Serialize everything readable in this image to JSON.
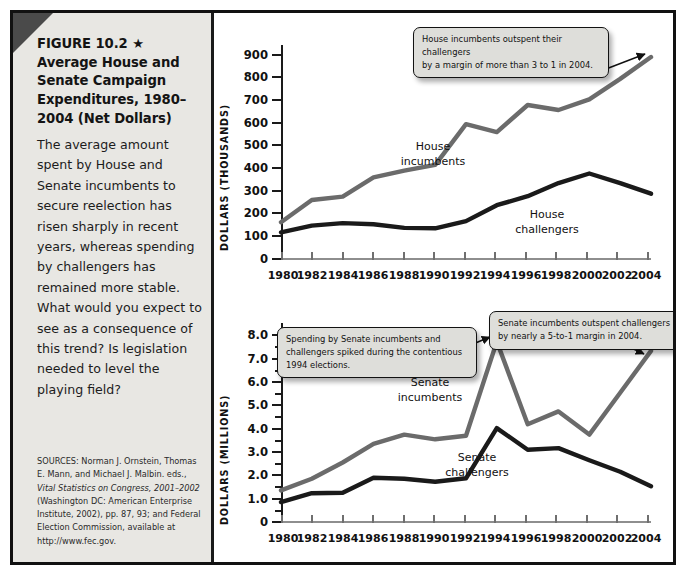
{
  "figure": {
    "title_lines": [
      "FIGURE 10.2 ★",
      "Average House and",
      "Senate Campaign",
      "Expenditures, 1980–",
      "2004 (Net Dollars)"
    ],
    "caption": "The average amount spent by House and Senate incumbents to secure reelection has risen sharply in recent years, whereas spending by challengers has remained more stable. What would you expect to see as a consequence of this trend? Is legislation needed to level the playing field?",
    "sources_label": "SOURCES:",
    "sources": "SOURCES: Norman J. Ornstein, Thomas E. Mann, and Michael J. Malbin. eds., Vital Statistics on Congress, 2001–2002 (Washington DC: American Enterprise Institute, 2002), pp. 87, 93; and Federal Election Commission, available at http://www.fec.gov.",
    "sources_italic_part": "Vital Statistics on Congress, 2001–2002",
    "corner_color": "#4a4a4a",
    "panel_color": "#e8e7e3",
    "incumbent_color": "#6b6b6b",
    "challenger_color": "#1a1a1a"
  },
  "chart_data": [
    {
      "type": "line",
      "id": "house",
      "title": "",
      "xlabel": "",
      "ylabel": "DOLLARS (THOUSANDS)",
      "x": [
        1980,
        1982,
        1984,
        1986,
        1988,
        1990,
        1992,
        1994,
        1996,
        1998,
        2000,
        2002,
        2004
      ],
      "xtick_labels": [
        "1980",
        "1982",
        "1984",
        "1986",
        "1988",
        "1990",
        "1992",
        "1994",
        "1996",
        "1998",
        "2000",
        "2002",
        "2004"
      ],
      "ytick_labels": [
        "0",
        "100",
        "200",
        "300",
        "400",
        "500",
        "600",
        "700",
        "800",
        "900"
      ],
      "yticks": [
        0,
        100,
        200,
        300,
        400,
        500,
        600,
        700,
        800,
        900
      ],
      "ylim": [
        0,
        950
      ],
      "xlim": [
        1980,
        2004
      ],
      "grid": false,
      "legend": "inline-labels",
      "series": [
        {
          "name": "House incumbents",
          "color": "#6b6b6b",
          "values": [
            167,
            265,
            280,
            365,
            395,
            420,
            600,
            565,
            685,
            663,
            710,
            800,
            897
          ]
        },
        {
          "name": "House challengers",
          "color": "#1a1a1a",
          "values": [
            122,
            152,
            163,
            158,
            142,
            140,
            172,
            242,
            282,
            340,
            382,
            340,
            293
          ]
        }
      ]
    },
    {
      "type": "line",
      "id": "senate",
      "title": "",
      "xlabel": "",
      "ylabel": "DOLLARS (MILLIONS)",
      "x": [
        1980,
        1982,
        1984,
        1986,
        1988,
        1990,
        1992,
        1994,
        1996,
        1998,
        2000,
        2002,
        2004
      ],
      "xtick_labels": [
        "1980",
        "1982",
        "1984",
        "1986",
        "1988",
        "1990",
        "1992",
        "1994",
        "1996",
        "1998",
        "2000",
        "2002",
        "2004"
      ],
      "ytick_labels": [
        "0",
        "1.0",
        "2.0",
        "3.0",
        "4.0",
        "5.0",
        "6.0",
        "7.0",
        "8.0"
      ],
      "yticks": [
        0,
        1,
        2,
        3,
        4,
        5,
        6,
        7,
        8
      ],
      "ylim": [
        0,
        8.6
      ],
      "xlim": [
        1980,
        2004
      ],
      "grid": false,
      "legend": "inline-labels",
      "series": [
        {
          "name": "Senate incumbents",
          "color": "#6b6b6b",
          "values": [
            1.4,
            1.9,
            2.6,
            3.4,
            3.8,
            3.6,
            3.75,
            7.8,
            4.25,
            4.8,
            3.8,
            5.6,
            7.4
          ]
        },
        {
          "name": "Senate challengers",
          "color": "#1a1a1a",
          "values": [
            0.9,
            1.28,
            1.3,
            1.95,
            1.9,
            1.77,
            1.92,
            4.08,
            3.15,
            3.22,
            2.7,
            2.2,
            1.58
          ]
        }
      ]
    }
  ],
  "series_labels": {
    "house_incumbents": [
      "House",
      "incumbents"
    ],
    "house_challengers": [
      "House",
      "challengers"
    ],
    "senate_incumbents": [
      "Senate",
      "incumbents"
    ],
    "senate_challengers": [
      "Senate",
      "challengers"
    ]
  },
  "callouts": [
    {
      "id": "house-2004",
      "text": "House incumbents outspent their challengers by a margin of more than 3 to 1 in 2004.",
      "lines": [
        "House incumbents outspent their challengers",
        "by a margin of more than 3 to 1 in 2004."
      ]
    },
    {
      "id": "senate-1994",
      "text": "Spending by Senate incumbents and challengers spiked during the contentious 1994 elections.",
      "lines": [
        "Spending by Senate incumbents and",
        "challengers spiked during the contentious",
        "1994 elections."
      ]
    },
    {
      "id": "senate-2004",
      "text": "Senate incumbents outspent challengers by nearly a 5-to-1 margin in 2004.",
      "lines": [
        "Senate incumbents outspent challengers",
        "by nearly a 5-to-1 margin in 2004."
      ]
    }
  ]
}
